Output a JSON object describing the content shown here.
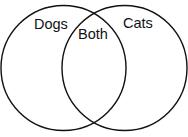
{
  "diagram": {
    "type": "venn",
    "sets": [
      {
        "label": "Dogs",
        "cx": 63.5,
        "cy": 68,
        "r": 62.5
      },
      {
        "label": "Cats",
        "cx": 124.5,
        "cy": 68,
        "r": 62.5
      }
    ],
    "intersection_label": "Both",
    "stroke_color": "#111111",
    "background": "#ffffff"
  }
}
